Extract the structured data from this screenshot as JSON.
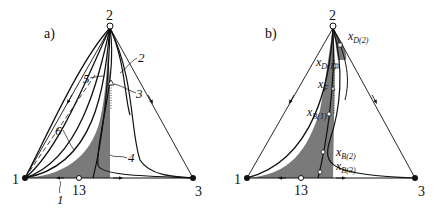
{
  "panels": [
    {
      "id": "a",
      "label": "a)",
      "vertices": {
        "top": "2",
        "left": "1",
        "right": "3"
      },
      "azeotrope": "13",
      "curve_labels": [
        "1",
        "2",
        "3",
        "4",
        "5",
        "6"
      ]
    },
    {
      "id": "b",
      "label": "b)",
      "vertices": {
        "top": "2",
        "left": "1",
        "right": "3"
      },
      "azeotrope": "13",
      "points": {
        "xD2": {
          "main": "x",
          "sub": "D(2)"
        },
        "xD1": {
          "main": "x",
          "sub": "D(1)"
        },
        "xF": {
          "main": "x",
          "sub": "F"
        },
        "xB1": {
          "main": "x",
          "sub": "B(1)"
        },
        "xB2": {
          "main": "x",
          "sub": "B(2)"
        },
        "xB3": {
          "main": "x",
          "sub": "B(3)"
        }
      }
    }
  ],
  "colors": {
    "shade": "#7a7a7a",
    "line": "#111111"
  }
}
